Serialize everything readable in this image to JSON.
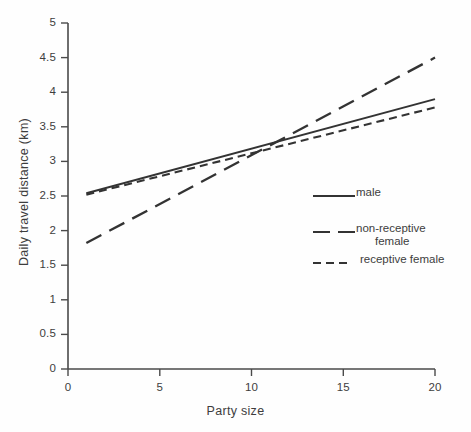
{
  "chart_data": {
    "type": "line",
    "title": "",
    "xlabel": "Party size",
    "ylabel": "Daily travel distance (km)",
    "xlim": [
      0,
      20
    ],
    "ylim": [
      0,
      5
    ],
    "xticks": [
      "0",
      "5",
      "10",
      "15",
      "20"
    ],
    "xtick_values": [
      0,
      5,
      10,
      15,
      20
    ],
    "yticks": [
      "0",
      "0.5",
      "1",
      "1.5",
      "2",
      "2.5",
      "3",
      "3.5",
      "4",
      "4.5",
      "5"
    ],
    "ytick_values": [
      0,
      0.5,
      1,
      1.5,
      2,
      2.5,
      3,
      3.5,
      4,
      4.5,
      5
    ],
    "grid": false,
    "legend_position": "right-inside",
    "x": [
      1,
      20
    ],
    "series": [
      {
        "name": "male",
        "style": "solid",
        "values": [
          2.54,
          3.9
        ],
        "color": "#333333"
      },
      {
        "name": "non-receptive female",
        "style": "long-dash",
        "values": [
          1.82,
          4.5
        ],
        "color": "#333333"
      },
      {
        "name": "receptive female",
        "style": "short-dash",
        "values": [
          2.52,
          3.78
        ],
        "color": "#333333"
      }
    ]
  },
  "legend": {
    "items": [
      {
        "label": "male",
        "label_line2": ""
      },
      {
        "label": "non-receptive",
        "label_line2": "female"
      },
      {
        "label": "receptive female",
        "label_line2": ""
      }
    ]
  },
  "axes": {
    "axis_color": "#4a4a4a"
  }
}
